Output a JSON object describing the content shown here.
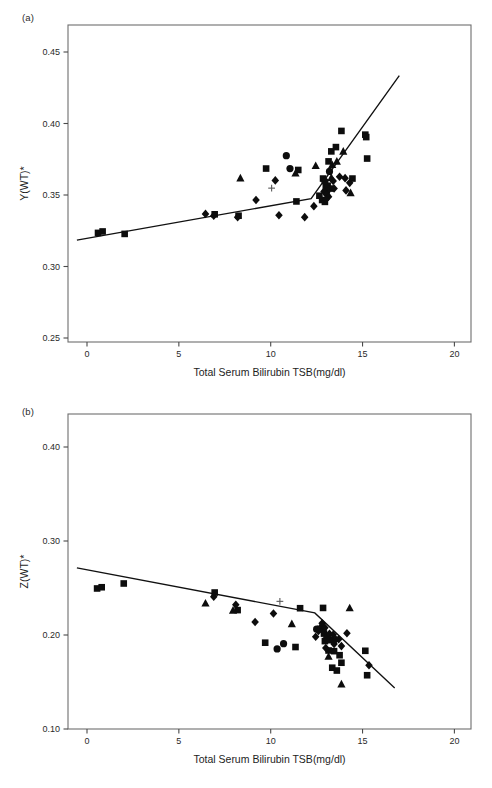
{
  "figure": {
    "panels": [
      {
        "id": "a",
        "label": "(a)",
        "xlabel": "Total Serum Bilirubin TSB(mg/dl)",
        "ylabel": "Y(WT)*"
      },
      {
        "id": "b",
        "label": "(b)",
        "xlabel": "Total Serum Bilirubin TSB(mg/dl)",
        "ylabel": "Z(WT)*"
      }
    ]
  },
  "chart_data": [
    {
      "type": "scatter",
      "panel": "a",
      "title": "",
      "xlabel": "Total Serum Bilirubin TSB(mg/dl)",
      "ylabel": "Y(WT)*",
      "xlim": [
        -0.7,
        21.0
      ],
      "ylim": [
        0.25,
        0.467
      ],
      "xticks": [
        0,
        5,
        10,
        15,
        20
      ],
      "xticklabels": [
        "0",
        "5",
        "10",
        "15",
        "20"
      ],
      "yticks": [
        0.25,
        0.3,
        0.35,
        0.4,
        0.45
      ],
      "yticklabels": [
        "0.25",
        "0.30",
        "0.35",
        "0.40",
        "0.45"
      ],
      "grid": false,
      "legend": "none",
      "marker_color": "#0d0d0d",
      "line_color": "#111111",
      "fit_line": {
        "description": "two-segment piecewise linear fit with breakpoint near TSB=12.2",
        "points": [
          [
            -0.55,
            0.3185
          ],
          [
            12.2,
            0.3475
          ],
          [
            17.0,
            0.4335
          ]
        ]
      },
      "series": [
        {
          "name": "square",
          "marker": "square",
          "points": [
            [
              0.6,
              0.3235
            ],
            [
              0.85,
              0.3245
            ],
            [
              2.05,
              0.3228
            ],
            [
              6.95,
              0.3365
            ],
            [
              8.25,
              0.3355
            ],
            [
              9.75,
              0.3685
            ],
            [
              11.5,
              0.3675
            ],
            [
              11.4,
              0.3455
            ],
            [
              12.65,
              0.3495
            ],
            [
              12.8,
              0.3465
            ],
            [
              12.95,
              0.3452
            ],
            [
              13.0,
              0.3555
            ],
            [
              13.1,
              0.3565
            ],
            [
              13.15,
              0.3735
            ],
            [
              13.3,
              0.3805
            ],
            [
              13.55,
              0.3835
            ],
            [
              13.85,
              0.3948
            ],
            [
              13.25,
              0.3545
            ],
            [
              12.85,
              0.3615
            ],
            [
              15.15,
              0.3922
            ],
            [
              15.2,
              0.3905
            ],
            [
              15.25,
              0.3755
            ],
            [
              14.45,
              0.3615
            ]
          ]
        },
        {
          "name": "circle",
          "marker": "circle",
          "points": [
            [
              10.85,
              0.3775
            ],
            [
              11.05,
              0.3685
            ],
            [
              13.2,
              0.3665
            ],
            [
              12.95,
              0.3595
            ],
            [
              13.05,
              0.3525
            ]
          ]
        },
        {
          "name": "triangle",
          "marker": "triangle",
          "points": [
            [
              8.35,
              0.3618
            ],
            [
              11.35,
              0.3652
            ],
            [
              12.45,
              0.3705
            ],
            [
              13.35,
              0.3712
            ],
            [
              13.6,
              0.3735
            ],
            [
              13.95,
              0.3805
            ],
            [
              14.35,
              0.3515
            ],
            [
              13.3,
              0.3622
            ]
          ]
        },
        {
          "name": "diamond",
          "marker": "diamond",
          "points": [
            [
              6.45,
              0.3368
            ],
            [
              6.9,
              0.3355
            ],
            [
              8.2,
              0.3345
            ],
            [
              9.2,
              0.3465
            ],
            [
              10.25,
              0.3602
            ],
            [
              10.45,
              0.3358
            ],
            [
              12.35,
              0.3422
            ],
            [
              12.9,
              0.3525
            ],
            [
              13.05,
              0.3502
            ],
            [
              13.15,
              0.3488
            ],
            [
              13.4,
              0.3598
            ],
            [
              13.45,
              0.3545
            ],
            [
              13.75,
              0.3628
            ],
            [
              14.05,
              0.3618
            ],
            [
              14.1,
              0.3532
            ],
            [
              14.3,
              0.3585
            ],
            [
              11.85,
              0.3345
            ],
            [
              13.0,
              0.3468
            ]
          ]
        },
        {
          "name": "plus",
          "marker": "plus",
          "points": [
            [
              10.05,
              0.3548
            ]
          ]
        }
      ]
    },
    {
      "type": "scatter",
      "panel": "b",
      "title": "",
      "xlabel": "Total Serum Bilirubin TSB(mg/dl)",
      "ylabel": "Z(WT)*",
      "xlim": [
        -0.7,
        21.0
      ],
      "ylim": [
        0.1,
        0.435
      ],
      "xticks": [
        0,
        5,
        10,
        15,
        20
      ],
      "xticklabels": [
        "0",
        "5",
        "10",
        "15",
        "20"
      ],
      "yticks": [
        0.1,
        0.2,
        0.3,
        0.4
      ],
      "yticklabels": [
        "0.10",
        "0.20",
        "0.30",
        "0.40"
      ],
      "grid": false,
      "legend": "none",
      "marker_color": "#0d0d0d",
      "line_color": "#111111",
      "fit_line": {
        "description": "two-segment piecewise linear fit with breakpoint near TSB=12.4",
        "points": [
          [
            -0.55,
            0.2715
          ],
          [
            12.4,
            0.2235
          ],
          [
            16.75,
            0.1435
          ]
        ]
      },
      "series": [
        {
          "name": "square",
          "marker": "square",
          "points": [
            [
              0.55,
              0.2495
            ],
            [
              0.8,
              0.2508
            ],
            [
              2.0,
              0.2548
            ],
            [
              6.95,
              0.2452
            ],
            [
              8.2,
              0.2265
            ],
            [
              9.7,
              0.1918
            ],
            [
              11.35,
              0.1872
            ],
            [
              11.6,
              0.2285
            ],
            [
              12.85,
              0.2288
            ],
            [
              12.7,
              0.2065
            ],
            [
              12.9,
              0.2015
            ],
            [
              13.1,
              0.1985
            ],
            [
              13.3,
              0.1945
            ],
            [
              13.15,
              0.1835
            ],
            [
              13.45,
              0.1828
            ],
            [
              13.75,
              0.1785
            ],
            [
              13.85,
              0.1705
            ],
            [
              13.35,
              0.1652
            ],
            [
              13.6,
              0.1622
            ],
            [
              15.15,
              0.1832
            ],
            [
              15.25,
              0.1572
            ],
            [
              12.95,
              0.1935
            ]
          ]
        },
        {
          "name": "circle",
          "marker": "circle",
          "points": [
            [
              10.7,
              0.1908
            ],
            [
              10.35,
              0.1852
            ],
            [
              12.85,
              0.2055
            ],
            [
              13.05,
              0.1968
            ],
            [
              12.5,
              0.2062
            ]
          ]
        },
        {
          "name": "triangle",
          "marker": "triangle",
          "points": [
            [
              6.45,
              0.2338
            ],
            [
              7.95,
              0.2262
            ],
            [
              11.15,
              0.2118
            ],
            [
              14.3,
              0.2288
            ],
            [
              13.85,
              0.1478
            ],
            [
              13.15,
              0.1772
            ],
            [
              12.75,
              0.2102
            ]
          ]
        },
        {
          "name": "diamond",
          "marker": "diamond",
          "points": [
            [
              6.9,
              0.2408
            ],
            [
              8.1,
              0.2322
            ],
            [
              9.15,
              0.2138
            ],
            [
              10.15,
              0.2228
            ],
            [
              12.6,
              0.2042
            ],
            [
              12.8,
              0.2125
            ],
            [
              12.95,
              0.2078
            ],
            [
              13.2,
              0.2012
            ],
            [
              13.4,
              0.2002
            ],
            [
              13.45,
              0.1905
            ],
            [
              13.55,
              0.1952
            ],
            [
              13.85,
              0.1882
            ],
            [
              14.15,
              0.2018
            ],
            [
              12.45,
              0.1982
            ],
            [
              13.0,
              0.1862
            ],
            [
              15.35,
              0.1678
            ],
            [
              13.7,
              0.1955
            ]
          ]
        },
        {
          "name": "plus",
          "marker": "plus",
          "points": [
            [
              10.5,
              0.2358
            ]
          ]
        }
      ]
    }
  ]
}
